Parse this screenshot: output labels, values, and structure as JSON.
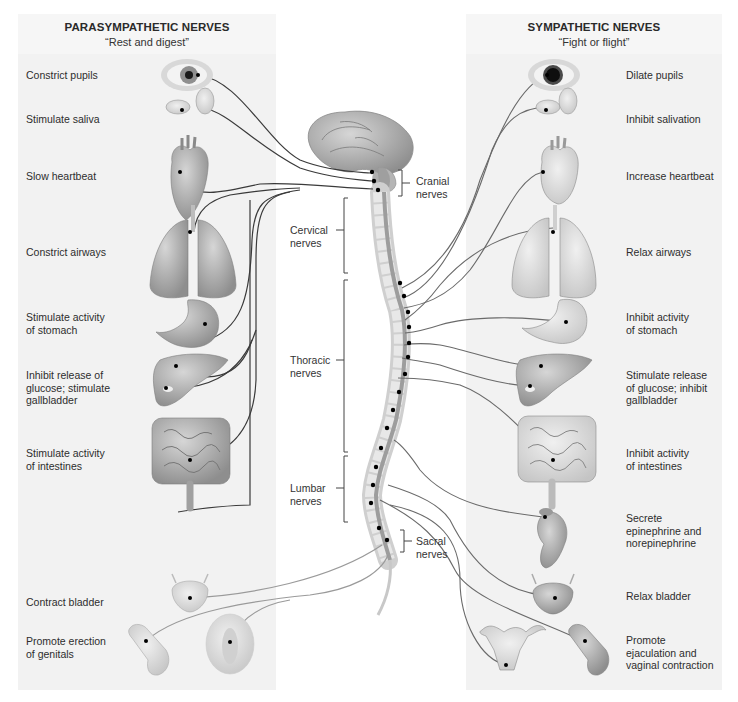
{
  "parasympathetic": {
    "title": "PARASYMPATHETIC NERVES",
    "subtitle": "“Rest and digest”",
    "effects": [
      {
        "organ": "eye",
        "label": "Constrict pupils"
      },
      {
        "organ": "salivary-glands",
        "label": "Stimulate saliva"
      },
      {
        "organ": "heart",
        "label": "Slow heartbeat"
      },
      {
        "organ": "lungs",
        "label": "Constrict airways"
      },
      {
        "organ": "stomach",
        "label": "Stimulate activity\nof stomach"
      },
      {
        "organ": "liver",
        "label": "Inhibit release of\nglucose; stimulate\ngallbladder"
      },
      {
        "organ": "intestines",
        "label": "Stimulate activity\nof intestines"
      },
      {
        "organ": "bladder",
        "label": "Contract bladder"
      },
      {
        "organ": "genitals",
        "label": "Promote erection\nof genitals"
      }
    ]
  },
  "sympathetic": {
    "title": "SYMPATHETIC NERVES",
    "subtitle": "“Fight or flight”",
    "effects": [
      {
        "organ": "eye",
        "label": "Dilate pupils"
      },
      {
        "organ": "salivary-glands",
        "label": "Inhibit salivation"
      },
      {
        "organ": "heart",
        "label": "Increase heartbeat"
      },
      {
        "organ": "lungs",
        "label": "Relax airways"
      },
      {
        "organ": "stomach",
        "label": "Inhibit activity\nof stomach"
      },
      {
        "organ": "liver",
        "label": "Stimulate release\nof glucose; inhibit\ngallbladder"
      },
      {
        "organ": "intestines",
        "label": "Inhibit activity\nof intestines"
      },
      {
        "organ": "adrenal-kidney",
        "label": "Secrete\nepinephrine and\nnorepinephrine"
      },
      {
        "organ": "bladder",
        "label": "Relax bladder"
      },
      {
        "organ": "genitals",
        "label": "Promote\nejaculation and\nvaginal contraction"
      }
    ]
  },
  "spine_regions": {
    "cranial": "Cranial\nnerves",
    "cervical": "Cervical\nnerves",
    "thoracic": "Thoracic\nnerves",
    "lumbar": "Lumbar\nnerves",
    "sacral": "Sacral\nnerves"
  },
  "colors": {
    "panel_bg": "#f2f2f2",
    "organ_fill": "#a9a9a9",
    "organ_light": "#cfcfcf",
    "para_nerve": "#333333",
    "symp_nerve": "#666666",
    "node": "#000000"
  }
}
